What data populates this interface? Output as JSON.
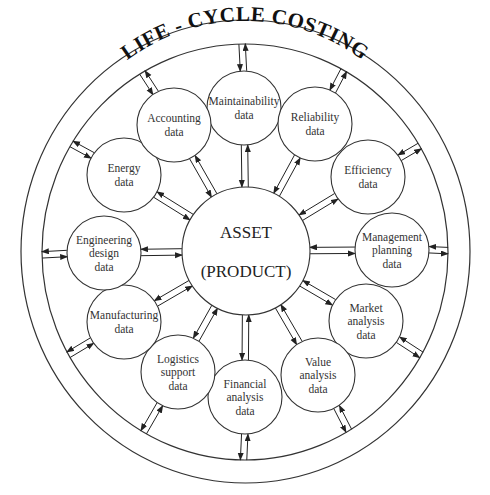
{
  "title": "LIFE - CYCLE COSTING",
  "center": {
    "line1": "ASSET",
    "line2": "(PRODUCT)"
  },
  "nodes": [
    {
      "id": "maintainability",
      "lines": [
        "Maintainability",
        "data"
      ],
      "cx": 244,
      "cy": 108
    },
    {
      "id": "reliability",
      "lines": [
        "Reliability",
        "data"
      ],
      "cx": 315,
      "cy": 124
    },
    {
      "id": "efficiency",
      "lines": [
        "Efficiency",
        "data"
      ],
      "cx": 368,
      "cy": 177
    },
    {
      "id": "management",
      "lines": [
        "Management",
        "planning",
        "data"
      ],
      "cx": 392,
      "cy": 250
    },
    {
      "id": "market",
      "lines": [
        "Market",
        "analysis",
        "data"
      ],
      "cx": 366,
      "cy": 321
    },
    {
      "id": "value",
      "lines": [
        "Value",
        "analysis",
        "data"
      ],
      "cx": 318,
      "cy": 375
    },
    {
      "id": "financial",
      "lines": [
        "Financial",
        "analysis",
        "data"
      ],
      "cx": 245,
      "cy": 397
    },
    {
      "id": "logistics",
      "lines": [
        "Logistics",
        "support",
        "data"
      ],
      "cx": 178,
      "cy": 372
    },
    {
      "id": "manufacturing",
      "lines": [
        "Manufacturing",
        "data"
      ],
      "cx": 124,
      "cy": 322
    },
    {
      "id": "engineering",
      "lines": [
        "Engineering",
        "design",
        "data"
      ],
      "cx": 104,
      "cy": 253
    },
    {
      "id": "energy",
      "lines": [
        "Energy",
        "data"
      ],
      "cx": 124,
      "cy": 175
    },
    {
      "id": "accounting",
      "lines": [
        "Accounting",
        "data"
      ],
      "cx": 174,
      "cy": 125
    }
  ]
}
